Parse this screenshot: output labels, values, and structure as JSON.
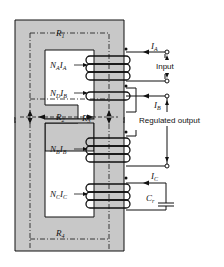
{
  "diagram": {
    "core_color": "#c8c8c8",
    "line_color": "#111111",
    "reluctances": {
      "r1": {
        "main": "R",
        "sub": "1"
      },
      "r2": {
        "main": "R",
        "sub": "2"
      },
      "r3": {
        "main": "R",
        "sub": "3"
      },
      "r4": {
        "main": "R",
        "sub": "4"
      }
    },
    "windings": {
      "a": {
        "n": "N",
        "n_sub": "A",
        "i": "I",
        "i_sub": "A"
      },
      "d": {
        "n": "N",
        "n_sub": "D",
        "i": "I",
        "i_sub": "B"
      },
      "b": {
        "n": "N",
        "n_sub": "B",
        "i": "I",
        "i_sub": "B"
      },
      "c": {
        "n": "N",
        "n_sub": "C",
        "i": "I",
        "i_sub": "C"
      }
    },
    "currents": {
      "ia": {
        "main": "I",
        "sub": "A"
      },
      "ib": {
        "main": "I",
        "sub": "B"
      },
      "ic": {
        "main": "I",
        "sub": "C"
      }
    },
    "labels": {
      "input": "Input",
      "regulated_output": "Regulated output",
      "capacitor": {
        "main": "C",
        "sub": "r"
      }
    }
  }
}
